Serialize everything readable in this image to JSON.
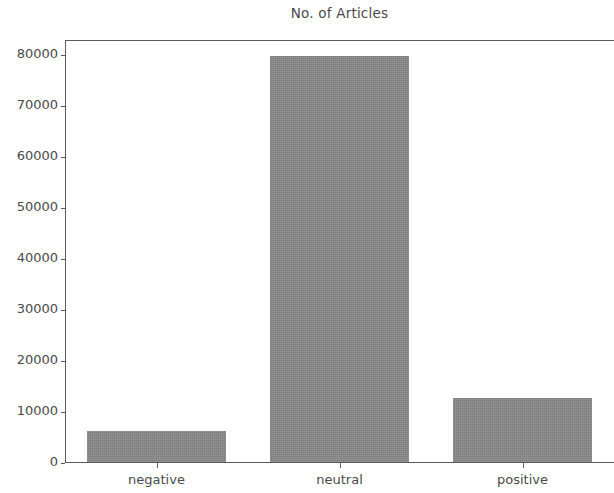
{
  "chart_data": {
    "type": "bar",
    "title": "No. of Articles",
    "xlabel": "",
    "ylabel": "",
    "categories": [
      "negative",
      "neutral",
      "positive"
    ],
    "values": [
      6100,
      79600,
      12500
    ],
    "ylim": [
      0,
      83000
    ],
    "yticks": [
      0,
      10000,
      20000,
      30000,
      40000,
      50000,
      60000,
      70000,
      80000
    ],
    "ytick_labels": [
      "0",
      "10000",
      "20000",
      "30000",
      "40000",
      "50000",
      "60000",
      "70000",
      "80000"
    ],
    "grid": false,
    "legend": null,
    "bar_color": "#8a8a8a",
    "axis_color": "#5a5a5a",
    "text_color": "#4a4a4a",
    "background": "#ffffff"
  }
}
